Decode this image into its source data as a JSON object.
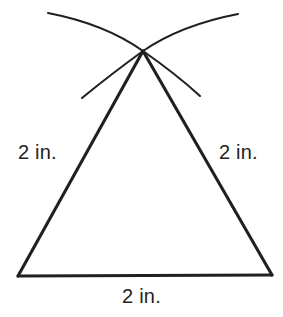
{
  "figure": {
    "background_color": "#ffffff",
    "stroke_color": "#231f20",
    "text_color": "#231f20",
    "width": 283,
    "height": 317
  },
  "labels": {
    "left_side": "2 in.",
    "right_side": "2 in.",
    "base": "2 in."
  },
  "geometry": {
    "apex": {
      "x": 143,
      "y": 51
    },
    "base_left": {
      "x": 18,
      "y": 276
    },
    "base_right": {
      "x": 272,
      "y": 275
    },
    "arc_left": {
      "start": {
        "x": 48,
        "y": 13
      },
      "end": {
        "x": 200,
        "y": 96
      },
      "through_apex": true
    },
    "arc_right": {
      "start": {
        "x": 238,
        "y": 14
      },
      "end": {
        "x": 82,
        "y": 98
      },
      "through_apex": true
    },
    "stroke_width_triangle": 3.0,
    "stroke_width_arc": 2.0
  }
}
